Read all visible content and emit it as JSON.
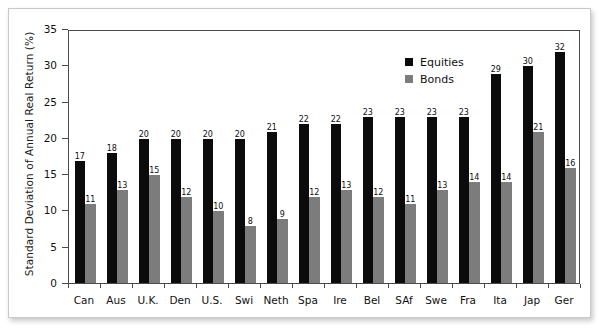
{
  "chart_data": {
    "type": "bar",
    "title": "",
    "xlabel": "",
    "ylabel": "Standard Deviation of Annual Real Return (%)",
    "ylim": [
      0,
      35
    ],
    "yticks": [
      "0",
      "5",
      "10",
      "15",
      "20",
      "25",
      "30",
      "35"
    ],
    "grid": false,
    "legend_position": "top-right",
    "categories": [
      "Can",
      "Aus",
      "U.K.",
      "Den",
      "U.S.",
      "Swi",
      "Neth",
      "Spa",
      "Ire",
      "Bel",
      "SAf",
      "Swe",
      "Fra",
      "Ita",
      "Jap",
      "Ger"
    ],
    "series": [
      {
        "name": "Equities",
        "color": "#0b0b0b",
        "values": [
          17,
          18,
          20,
          20,
          20,
          20,
          21,
          22,
          22,
          23,
          23,
          23,
          23,
          29,
          30,
          32
        ]
      },
      {
        "name": "Bonds",
        "color": "#7c7c7c",
        "values": [
          11,
          13,
          15,
          12,
          10,
          8,
          9,
          12,
          13,
          12,
          11,
          13,
          14,
          14,
          21,
          16
        ]
      }
    ]
  },
  "legend": {
    "items": [
      {
        "label": "Equities",
        "swatch": "equities"
      },
      {
        "label": "Bonds",
        "swatch": "bonds"
      }
    ]
  }
}
